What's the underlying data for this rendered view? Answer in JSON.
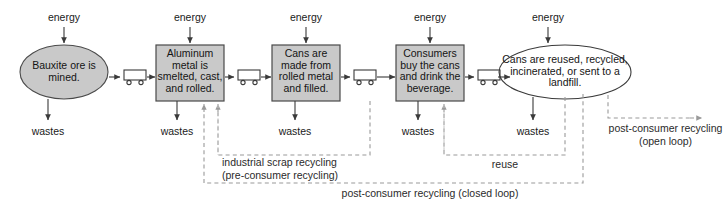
{
  "diagram": {
    "colors": {
      "node_fill": "#c9c9c9",
      "node_stroke": "#4a4a4a",
      "ellipse_last_fill": "#ffffff",
      "arrow": "#3a3a3a",
      "dashed": "#9a9a9a",
      "text": "#1a1a1a"
    },
    "stages": [
      {
        "id": "bauxite",
        "shape": "ellipse",
        "filled": true,
        "label": "Bauxite ore is\nmined."
      },
      {
        "id": "smelting",
        "shape": "box",
        "filled": true,
        "label": "Aluminum\nmetal is\nsmelted, cast,\nand rolled."
      },
      {
        "id": "cans-made",
        "shape": "box",
        "filled": true,
        "label": "Cans are\nmade from\nrolled metal\nand filled."
      },
      {
        "id": "consumers",
        "shape": "box",
        "filled": true,
        "label": "Consumers\nbuy the cans\nand drink the\nbeverage."
      },
      {
        "id": "end-of-life",
        "shape": "ellipse",
        "filled": false,
        "label": "Cans are reused,\nrecycled, incinerated,\nor sent to a landfill."
      }
    ],
    "energy_inputs": [
      {
        "for": "bauxite",
        "label": "energy"
      },
      {
        "for": "smelting",
        "label": "energy"
      },
      {
        "for": "cans-made",
        "label": "energy"
      },
      {
        "for": "consumers",
        "label": "energy"
      },
      {
        "for": "end-of-life",
        "label": "energy"
      }
    ],
    "waste_outputs": [
      {
        "for": "bauxite",
        "label": "wastes"
      },
      {
        "for": "smelting",
        "label": "wastes"
      },
      {
        "for": "cans-made",
        "label": "wastes"
      },
      {
        "for": "consumers",
        "label": "wastes"
      },
      {
        "for": "end-of-life",
        "label": "wastes"
      }
    ],
    "transport_icons": [
      {
        "between": "bauxite-smelting",
        "icon": "truck-icon"
      },
      {
        "between": "smelting-cans-made",
        "icon": "truck-icon"
      },
      {
        "between": "cans-made-consumers",
        "icon": "truck-icon"
      },
      {
        "between": "consumers-end-of-life",
        "icon": "truck-icon"
      }
    ],
    "loops": [
      {
        "id": "industrial-scrap",
        "label": "industrial scrap recycling\n(pre-consumer recycling)"
      },
      {
        "id": "reuse",
        "label": "reuse"
      },
      {
        "id": "closed-loop",
        "label": "post-consumer recycling (closed loop)"
      },
      {
        "id": "open-loop",
        "label": "post-consumer recycling\n(open loop)"
      }
    ]
  }
}
